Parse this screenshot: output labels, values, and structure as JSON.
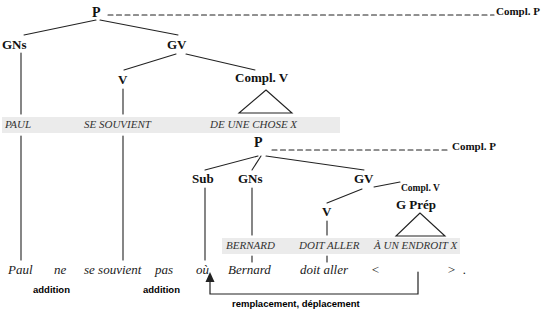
{
  "diagram": {
    "colors": {
      "band": "#ebebeb",
      "line": "#222222",
      "text": "#111111",
      "abstract_text": "#333333"
    }
  },
  "matrix_tree": {
    "root": "P",
    "root_relation": "Compl. P",
    "nodes": {
      "gns": "GNs",
      "gv": "GV",
      "v": "V",
      "compl_v": "Compl. V"
    }
  },
  "matrix_terminals": [
    {
      "text": "PAUL"
    },
    {
      "text": "SE SOUVIENT"
    },
    {
      "text": "DE UNE CHOSE X"
    }
  ],
  "embedded_tree": {
    "root": "P",
    "root_relation": "Compl. P",
    "nodes": {
      "sub": "Sub",
      "gns": "GNs",
      "gv": "GV",
      "v": "V",
      "compl_v": "Compl. V",
      "g_prep": "G Prép"
    }
  },
  "embedded_terminals": [
    {
      "text": "BERNARD"
    },
    {
      "text": "DOIT ALLER"
    },
    {
      "text": "À UN ENDROIT X"
    }
  ],
  "surface_sentence": [
    {
      "text": "Paul"
    },
    {
      "text": "ne"
    },
    {
      "text": "se souvient"
    },
    {
      "text": "pas"
    },
    {
      "text": "où"
    },
    {
      "text": "Bernard"
    },
    {
      "text": "doit aller"
    },
    {
      "text": "<"
    },
    {
      "text": ">"
    },
    {
      "text": "."
    }
  ],
  "operations": [
    {
      "label": "addition"
    },
    {
      "label": "addition"
    },
    {
      "label": "remplacement, déplacement"
    }
  ]
}
